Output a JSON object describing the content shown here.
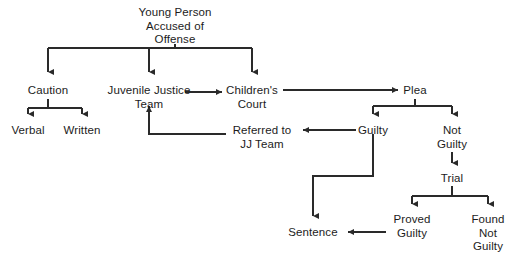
{
  "diagram": {
    "stroke_color": "#2a2a2a",
    "text_color": "#1c1c1c",
    "background_color": "#ffffff",
    "nodes": [
      {
        "id": "accused",
        "label": "Young Person\nAccused of\nOffense",
        "x": 175,
        "y": 6,
        "lines": 3
      },
      {
        "id": "caution",
        "label": "Caution",
        "x": 48,
        "y": 84,
        "lines": 1
      },
      {
        "id": "jj_team",
        "label": "Juvenile Justice\nTeam",
        "x": 149,
        "y": 84,
        "lines": 2
      },
      {
        "id": "childrens_court",
        "label": "Children's\nCourt",
        "x": 252,
        "y": 84,
        "lines": 2
      },
      {
        "id": "plea",
        "label": "Plea",
        "x": 415,
        "y": 84,
        "lines": 1
      },
      {
        "id": "verbal",
        "label": "Verbal",
        "x": 28,
        "y": 124,
        "lines": 1
      },
      {
        "id": "written",
        "label": "Written",
        "x": 82,
        "y": 124,
        "lines": 1
      },
      {
        "id": "referred",
        "label": "Referred to\nJJ Team",
        "x": 262,
        "y": 124,
        "lines": 2
      },
      {
        "id": "guilty",
        "label": "Guilty",
        "x": 373,
        "y": 124,
        "lines": 1
      },
      {
        "id": "not_guilty",
        "label": "Not\nGuilty",
        "x": 452,
        "y": 124,
        "lines": 2
      },
      {
        "id": "trial",
        "label": "Trial",
        "x": 452,
        "y": 172,
        "lines": 1
      },
      {
        "id": "sentence",
        "label": "Sentence",
        "x": 313,
        "y": 226,
        "lines": 1
      },
      {
        "id": "proved_guilty",
        "label": "Proved\nGuilty",
        "x": 412,
        "y": 213,
        "lines": 2
      },
      {
        "id": "found_not_guilty",
        "label": "Found\nNot\nGuilty",
        "x": 488,
        "y": 213,
        "lines": 3
      }
    ],
    "edges": [
      {
        "from": "accused",
        "to": "caution",
        "name": "edge-accused-to-caution"
      },
      {
        "from": "accused",
        "to": "jj_team",
        "name": "edge-accused-to-jj-team"
      },
      {
        "from": "accused",
        "to": "childrens-court",
        "name": "edge-accused-to-childrens-court"
      },
      {
        "from": "caution",
        "to": "verbal",
        "name": "edge-caution-to-verbal"
      },
      {
        "from": "caution",
        "to": "written",
        "name": "edge-caution-to-written"
      },
      {
        "from": "jj_team",
        "to": "childrens_court",
        "name": "edge-jj-team-to-childrens-court"
      },
      {
        "from": "childrens_court",
        "to": "plea",
        "name": "edge-childrens-court-to-plea"
      },
      {
        "from": "plea",
        "to": "guilty",
        "name": "edge-plea-to-guilty"
      },
      {
        "from": "plea",
        "to": "not_guilty",
        "name": "edge-plea-to-not-guilty"
      },
      {
        "from": "guilty",
        "to": "referred",
        "name": "edge-guilty-to-referred"
      },
      {
        "from": "referred",
        "to": "jj_team",
        "name": "edge-referred-to-jj-team"
      },
      {
        "from": "guilty",
        "to": "sentence",
        "name": "edge-guilty-to-sentence"
      },
      {
        "from": "not_guilty",
        "to": "trial",
        "name": "edge-not-guilty-to-trial"
      },
      {
        "from": "trial",
        "to": "proved_guilty",
        "name": "edge-trial-to-proved-guilty"
      },
      {
        "from": "trial",
        "to": "found_not_guilty",
        "name": "edge-trial-to-found-not-guilty"
      },
      {
        "from": "proved_guilty",
        "to": "sentence",
        "name": "edge-proved-guilty-to-sentence"
      }
    ]
  }
}
